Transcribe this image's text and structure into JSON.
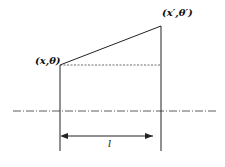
{
  "labels": {
    "input_point": "(x,θ)",
    "output_point": "(x′,θ′)",
    "length": "l"
  },
  "colors": {
    "line": "#222222",
    "background": "#ffffff"
  }
}
